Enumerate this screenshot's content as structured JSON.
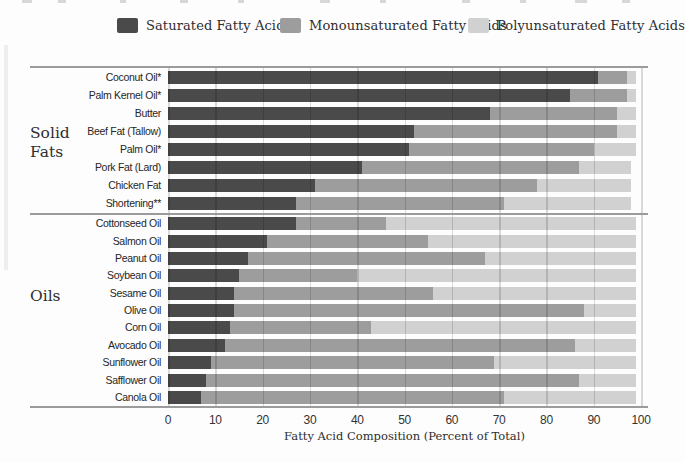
{
  "legend": {
    "items": [
      {
        "label": "Saturated Fatty Acids",
        "color": "#4a4a4a"
      },
      {
        "label": "Monounsaturated Fatty Acids",
        "color": "#9d9d9d"
      },
      {
        "label": "Polyunsaturated Fatty Acids",
        "color": "#d1d1d1"
      }
    ]
  },
  "chart_data": {
    "type": "bar",
    "orientation": "horizontal",
    "stacked": true,
    "title": "",
    "xlabel": "Fatty Acid Composition (Percent of Total)",
    "ylabel": "",
    "xlim": [
      0,
      100
    ],
    "xticks": [
      0,
      10,
      20,
      30,
      40,
      50,
      60,
      70,
      80,
      90,
      100
    ],
    "grid": true,
    "legend_position": "top",
    "series_names": [
      "Saturated Fatty Acids",
      "Monounsaturated Fatty Acids",
      "Polyunsaturated Fatty Acids"
    ],
    "series_colors": [
      "#4a4a4a",
      "#9d9d9d",
      "#d1d1d1"
    ],
    "value_unit": "percent of total fatty acids",
    "groups": [
      {
        "group": "Solid Fats",
        "rows": [
          {
            "label": "Coconut Oil*",
            "values": [
              91,
              6,
              2
            ]
          },
          {
            "label": "Palm Kernel Oil*",
            "values": [
              85,
              12,
              2
            ]
          },
          {
            "label": "Butter",
            "values": [
              68,
              27,
              4
            ]
          },
          {
            "label": "Beef Fat (Tallow)",
            "values": [
              52,
              43,
              4
            ]
          },
          {
            "label": "Palm Oil*",
            "values": [
              51,
              39,
              9
            ]
          },
          {
            "label": "Pork Fat (Lard)",
            "values": [
              41,
              46,
              11
            ]
          },
          {
            "label": "Chicken Fat",
            "values": [
              31,
              47,
              20
            ]
          },
          {
            "label": "Shortening**",
            "values": [
              27,
              44,
              27
            ]
          }
        ]
      },
      {
        "group": "Oils",
        "rows": [
          {
            "label": "Cottonseed Oil",
            "values": [
              27,
              19,
              53
            ]
          },
          {
            "label": "Salmon Oil",
            "values": [
              21,
              34,
              44
            ]
          },
          {
            "label": "Peanut Oil",
            "values": [
              17,
              50,
              32
            ]
          },
          {
            "label": "Soybean Oil",
            "values": [
              15,
              25,
              59
            ]
          },
          {
            "label": "Sesame Oil",
            "values": [
              14,
              42,
              43
            ]
          },
          {
            "label": "Olive Oil",
            "values": [
              14,
              74,
              11
            ]
          },
          {
            "label": "Corn Oil",
            "values": [
              13,
              30,
              56
            ]
          },
          {
            "label": "Avocado Oil",
            "values": [
              12,
              74,
              13
            ]
          },
          {
            "label": "Sunflower Oil",
            "values": [
              9,
              60,
              30
            ]
          },
          {
            "label": "Safflower Oil",
            "values": [
              8,
              79,
              12
            ]
          },
          {
            "label": "Canola Oil",
            "values": [
              7,
              64,
              28
            ]
          }
        ]
      }
    ]
  }
}
